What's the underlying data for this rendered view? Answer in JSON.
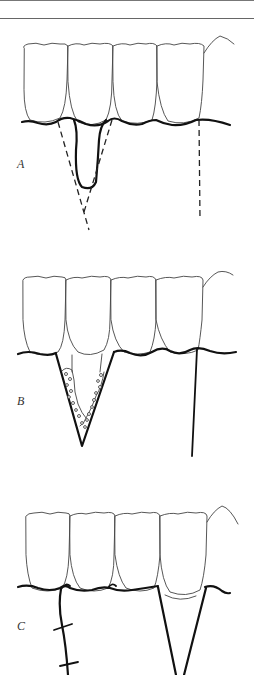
{
  "figure": {
    "type": "dental surgical procedure illustration",
    "panels": [
      {
        "label": "A",
        "description": "Incision lines (dashed) outlining a wedge around a gingival cleft; vertical releasing incision on the right"
      },
      {
        "label": "B",
        "description": "V-shaped wedge excision with graft particles lining the walls; vertical releasing incision on the right"
      },
      {
        "label": "C",
        "description": "Wedge closed with sutures on the left; open V-shaped donor site on the right"
      }
    ],
    "colors": {
      "line": "#111111",
      "thin_line": "#444444",
      "background": "#ffffff"
    }
  }
}
